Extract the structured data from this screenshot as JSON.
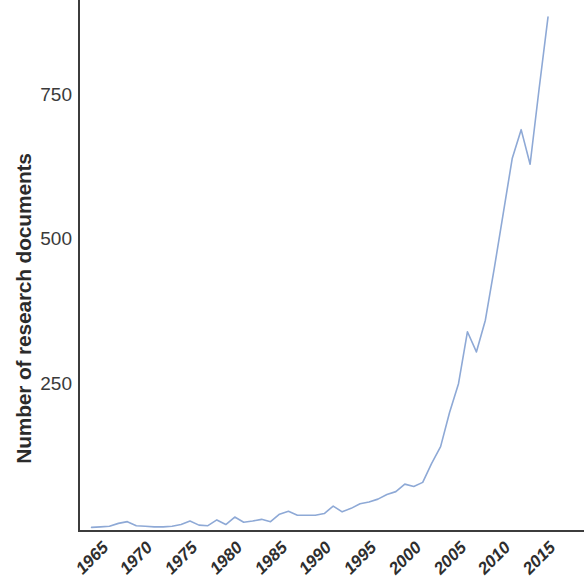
{
  "chart_data": {
    "type": "line",
    "title": "",
    "xlabel": "",
    "ylabel": "Number of research documents",
    "xlim": [
      1964,
      2016
    ],
    "ylim": [
      0,
      900
    ],
    "grid": false,
    "legend": null,
    "line_color": "#8ea9d6",
    "axis_color": "#3c3c3c",
    "y_ticks": [
      250,
      500,
      750
    ],
    "y_tick_labels": [
      "250",
      "500",
      "750"
    ],
    "x_ticks": [
      1965,
      1970,
      1975,
      1980,
      1985,
      1990,
      1995,
      2000,
      2005,
      2010,
      2015
    ],
    "x_tick_labels": [
      "1965",
      "1970",
      "1975",
      "1980",
      "1985",
      "1990",
      "1995",
      "2000",
      "2005",
      "2010",
      "2015"
    ],
    "series": [
      {
        "name": "Number of research documents",
        "x": [
          1964,
          1965,
          1966,
          1967,
          1968,
          1969,
          1970,
          1971,
          1972,
          1973,
          1974,
          1975,
          1976,
          1977,
          1978,
          1979,
          1980,
          1981,
          1982,
          1983,
          1984,
          1985,
          1986,
          1987,
          1988,
          1989,
          1990,
          1991,
          1992,
          1993,
          1994,
          1995,
          1996,
          1997,
          1998,
          1999,
          2000,
          2001,
          2002,
          2003,
          2004,
          2005,
          2006,
          2007,
          2008,
          2009,
          2010,
          2011,
          2012,
          2013,
          2014,
          2015
        ],
        "values": [
          1,
          2,
          3,
          8,
          11,
          4,
          3,
          2,
          2,
          3,
          6,
          12,
          5,
          4,
          14,
          6,
          19,
          10,
          12,
          15,
          11,
          24,
          29,
          22,
          22,
          22,
          25,
          38,
          28,
          34,
          42,
          45,
          50,
          58,
          63,
          76,
          72,
          79,
          112,
          141,
          200,
          250,
          340,
          305,
          360,
          450,
          545,
          640,
          690,
          630,
          760,
          885
        ]
      }
    ]
  },
  "axes": {
    "y_title": "Number of research documents"
  }
}
